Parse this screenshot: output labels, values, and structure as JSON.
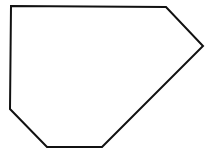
{
  "figure": {
    "width": 212,
    "height": 158,
    "background": "#ffffff",
    "shape": {
      "type": "hexagon",
      "points": "11,6 166,7 203,46 102,147 47,147 10,109",
      "stroke": "#111111",
      "stroke_width": 2,
      "fill": "#ffffff"
    }
  }
}
